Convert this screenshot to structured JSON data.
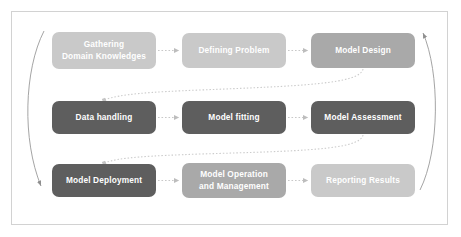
{
  "diagram": {
    "frame": {
      "name": "outer-frame"
    },
    "palette": {
      "light": "#c9c9c9",
      "medium": "#a9a9a9",
      "dark": "#5e5e5e",
      "connector": "#c0c0c0",
      "frame_border": "#d2d2d2",
      "background": "#ffffff",
      "node_text": "#ffffff"
    },
    "rows": [
      {
        "row_name": "row-planning",
        "nodes": [
          {
            "id": "gathering-domain-knowledges",
            "label": "Gathering\nDomain Knowledges",
            "tone": "light",
            "x": 52,
            "y": 32,
            "w": 104,
            "h": 37
          },
          {
            "id": "defining-problem",
            "label": "Defining Problem",
            "tone": "light",
            "x": 182,
            "y": 33,
            "w": 104,
            "h": 35
          },
          {
            "id": "model-design",
            "label": "Model Design",
            "tone": "medium",
            "x": 311,
            "y": 33,
            "w": 104,
            "h": 35
          }
        ]
      },
      {
        "row_name": "row-modeling",
        "nodes": [
          {
            "id": "data-handling",
            "label": "Data handling",
            "tone": "dark",
            "x": 52,
            "y": 101,
            "w": 104,
            "h": 33
          },
          {
            "id": "model-fitting",
            "label": "Model fitting",
            "tone": "dark",
            "x": 182,
            "y": 101,
            "w": 104,
            "h": 33
          },
          {
            "id": "model-assessment",
            "label": "Model Assessment",
            "tone": "dark",
            "x": 311,
            "y": 101,
            "w": 104,
            "h": 33
          }
        ]
      },
      {
        "row_name": "row-operations",
        "nodes": [
          {
            "id": "model-deployment",
            "label": "Model Deployment",
            "tone": "dark",
            "x": 52,
            "y": 164,
            "w": 104,
            "h": 33
          },
          {
            "id": "model-operation-and-management",
            "label": "Model Operation\nand Management",
            "tone": "medium",
            "x": 182,
            "y": 163,
            "w": 104,
            "h": 35
          },
          {
            "id": "reporting-results",
            "label": "Reporting Results",
            "tone": "light",
            "x": 311,
            "y": 164,
            "w": 104,
            "h": 33
          }
        ]
      }
    ],
    "connectors": [
      {
        "id": "arrow-gathering-to-defining",
        "kind": "dotted-arrow-horizontal"
      },
      {
        "id": "arrow-defining-to-model-design",
        "kind": "dotted-arrow-horizontal"
      },
      {
        "id": "arrow-data-handling-to-model-fitting",
        "kind": "dotted-arrow-horizontal"
      },
      {
        "id": "arrow-model-fitting-to-assessment",
        "kind": "dotted-arrow-horizontal"
      },
      {
        "id": "arrow-deployment-to-operation",
        "kind": "dotted-arrow-horizontal"
      },
      {
        "id": "arrow-operation-to-reporting",
        "kind": "dotted-arrow-horizontal"
      },
      {
        "id": "arrow-model-design-to-data-handling",
        "kind": "dotted-arrow-curved-wrap"
      },
      {
        "id": "arrow-assessment-to-deployment",
        "kind": "dotted-arrow-curved-wrap"
      },
      {
        "id": "arrow-left-loop-down",
        "kind": "solid-arc-arrow"
      },
      {
        "id": "arrow-right-loop-up",
        "kind": "solid-arc-arrow"
      }
    ]
  }
}
